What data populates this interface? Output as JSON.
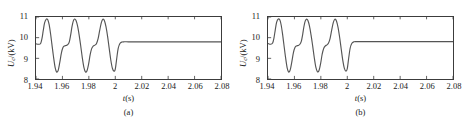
{
  "figure": {
    "background_color": "#ffffff",
    "axis_color": "#3c3c3c",
    "line_color": "#555555"
  },
  "panels": [
    {
      "caption": "(a)",
      "ylabel_var": "U",
      "ylabel_sub": "c",
      "ylabel_unit": "/(kV)",
      "xlabel_var": "t",
      "xlabel_unit": "(s)"
    },
    {
      "caption": "(b)",
      "ylabel_var": "U",
      "ylabel_sub": "c",
      "ylabel_unit": "/(kV)",
      "xlabel_var": "t",
      "xlabel_unit": "(s)"
    }
  ],
  "chart_data": [
    {
      "type": "line",
      "title": "",
      "subtitle": "(a)",
      "xlabel": "t(s)",
      "ylabel": "Uc/(kV)",
      "xlim": [
        1.94,
        2.08
      ],
      "ylim": [
        8,
        11
      ],
      "xticks": [
        1.94,
        1.96,
        1.98,
        2,
        2.02,
        2.04,
        2.06,
        2.08
      ],
      "xticklabels": [
        "1.94",
        "1.96",
        "1.98",
        "2",
        "2.02",
        "2.04",
        "2.06",
        "2.08"
      ],
      "yticks": [
        8,
        9,
        10,
        11
      ],
      "yticklabels": [
        "8",
        "9",
        "10",
        "11"
      ],
      "grid": false,
      "legend": null,
      "series": [
        {
          "name": "Uc",
          "x": [
            1.94,
            1.942,
            1.9435,
            1.9445,
            1.9455,
            1.9465,
            1.9478,
            1.949,
            1.95,
            1.951,
            1.952,
            1.9532,
            1.9545,
            1.9556,
            1.9568,
            1.958,
            1.9592,
            1.9604,
            1.9616,
            1.9628,
            1.964,
            1.9652,
            1.9662,
            1.9672,
            1.9682,
            1.9692,
            1.9702,
            1.9714,
            1.9726,
            1.9738,
            1.975,
            1.9762,
            1.9774,
            1.9786,
            1.9798,
            1.981,
            1.9822,
            1.9834,
            1.9846,
            1.9858,
            1.987,
            1.9882,
            1.9894,
            1.9906,
            1.9918,
            1.993,
            1.9942,
            1.9954,
            1.9966,
            1.9978,
            1.999,
            2.0,
            2.001,
            2.0022,
            2.0035,
            2.005,
            2.007,
            2.01,
            2.02,
            2.04,
            2.06,
            2.08
          ],
          "y": [
            9.7,
            9.68,
            9.72,
            9.95,
            10.35,
            10.72,
            10.9,
            10.86,
            10.62,
            10.2,
            9.7,
            9.1,
            8.55,
            8.34,
            8.42,
            8.8,
            9.25,
            9.52,
            9.6,
            9.62,
            9.66,
            9.8,
            10.12,
            10.52,
            10.8,
            10.9,
            10.84,
            10.58,
            10.15,
            9.62,
            9.05,
            8.58,
            8.35,
            8.4,
            8.72,
            9.18,
            9.48,
            9.6,
            9.64,
            9.72,
            9.95,
            10.35,
            10.72,
            10.89,
            10.82,
            10.52,
            10.05,
            9.48,
            8.92,
            8.52,
            8.38,
            8.48,
            8.95,
            9.48,
            9.72,
            9.79,
            9.8,
            9.8,
            9.8,
            9.8,
            9.8,
            9.8
          ]
        }
      ]
    },
    {
      "type": "line",
      "title": "",
      "subtitle": "(b)",
      "xlabel": "t(s)",
      "ylabel": "Uc/(kV)",
      "xlim": [
        1.94,
        2.08
      ],
      "ylim": [
        8,
        11
      ],
      "xticks": [
        1.94,
        1.96,
        1.98,
        2,
        2.02,
        2.04,
        2.06,
        2.08
      ],
      "xticklabels": [
        "1.94",
        "1.96",
        "1.98",
        "2",
        "2.02",
        "2.04",
        "2.06",
        "2.08"
      ],
      "yticks": [
        8,
        9,
        10,
        11
      ],
      "yticklabels": [
        "8",
        "9",
        "10",
        "11"
      ],
      "grid": false,
      "legend": null,
      "series": [
        {
          "name": "Uc",
          "x": [
            1.94,
            1.942,
            1.9435,
            1.9445,
            1.9455,
            1.9465,
            1.9478,
            1.949,
            1.95,
            1.951,
            1.952,
            1.9532,
            1.9545,
            1.9556,
            1.9568,
            1.958,
            1.9592,
            1.9604,
            1.9616,
            1.9628,
            1.964,
            1.9652,
            1.9662,
            1.9672,
            1.9682,
            1.9692,
            1.9702,
            1.9714,
            1.9726,
            1.9738,
            1.975,
            1.9762,
            1.9774,
            1.9786,
            1.9798,
            1.981,
            1.9822,
            1.9834,
            1.9846,
            1.9858,
            1.987,
            1.9882,
            1.9894,
            1.9906,
            1.9918,
            1.993,
            1.9942,
            1.9954,
            1.9966,
            1.9978,
            1.999,
            2.0,
            2.001,
            2.0022,
            2.0035,
            2.005,
            2.007,
            2.01,
            2.02,
            2.04,
            2.06,
            2.08
          ],
          "y": [
            9.72,
            9.68,
            9.74,
            9.98,
            10.38,
            10.74,
            10.9,
            10.85,
            10.6,
            10.18,
            9.68,
            9.08,
            8.54,
            8.34,
            8.44,
            8.82,
            9.26,
            9.52,
            9.6,
            9.62,
            9.67,
            9.82,
            10.14,
            10.54,
            10.81,
            10.9,
            10.83,
            10.56,
            10.12,
            9.6,
            9.04,
            8.57,
            8.35,
            8.41,
            8.74,
            9.2,
            9.49,
            9.6,
            9.65,
            9.74,
            9.97,
            10.37,
            10.73,
            10.89,
            10.81,
            10.5,
            10.02,
            9.45,
            8.9,
            8.51,
            8.38,
            8.5,
            8.98,
            9.5,
            9.73,
            9.8,
            9.81,
            9.81,
            9.81,
            9.81,
            9.81,
            9.81
          ]
        }
      ]
    }
  ]
}
